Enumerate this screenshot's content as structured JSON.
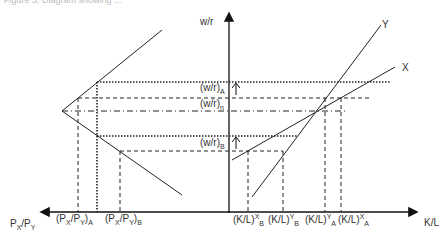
{
  "figure": {
    "title_partial": "Figure 3: Diagram showing ..."
  },
  "axes": {
    "vertical_label": "w/r",
    "horizontal_right_label": "K/L",
    "horizontal_left_label": {
      "base": "P",
      "sub1": "X",
      "mid": "/P",
      "sub2": "Y"
    }
  },
  "curves": {
    "y_label": "Y",
    "x_label": "X"
  },
  "wage_rent_labels": [
    {
      "id": "A",
      "base": "(w/r)",
      "sub": "A"
    },
    {
      "id": "n",
      "base": "(w/r)",
      "sub": "n"
    },
    {
      "id": "B",
      "base": "(w/r)",
      "sub": "B"
    }
  ],
  "price_ratio_labels": [
    {
      "id": "A",
      "text": "(P",
      "s1": "X",
      "mid": "/P",
      "s2": "Y",
      "end": ")",
      "sub": "A"
    },
    {
      "id": "B",
      "text": "(P",
      "s1": "X",
      "mid": "/P",
      "s2": "Y",
      "end": ")",
      "sub": "B"
    }
  ],
  "capital_labor_labels": [
    {
      "base": "(K/L)",
      "sup": "X",
      "sub": "B"
    },
    {
      "base": "(K/L)",
      "sup": "Y",
      "sub": "B"
    },
    {
      "base": "(K/L)",
      "sup": "Y",
      "sub": "A"
    },
    {
      "base": "(K/L)",
      "sup": "X",
      "sub": "A"
    }
  ],
  "colors": {
    "line": "#1a1a1a",
    "background": "#ffffff"
  }
}
